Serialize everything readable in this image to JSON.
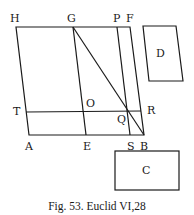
{
  "caption": "Fig. 53. Euclid VI,28",
  "labels": {
    "H": "H",
    "G": "G",
    "P": "P",
    "F": "F",
    "T": "T",
    "O": "O",
    "R": "R",
    "Q": "Q",
    "A": "A",
    "E": "E",
    "S": "S",
    "B": "B",
    "C": "C",
    "D": "D"
  },
  "points": {
    "H": [
      16,
      27
    ],
    "G": [
      73,
      27
    ],
    "P": [
      117,
      27
    ],
    "F": [
      130,
      27
    ],
    "T": [
      26,
      112
    ],
    "O": [
      83,
      112
    ],
    "Q": [
      128,
      111
    ],
    "R": [
      141,
      111
    ],
    "A": [
      29,
      135
    ],
    "E": [
      86,
      135
    ],
    "S": [
      130,
      135
    ],
    "B": [
      144,
      135
    ]
  },
  "shapes": {
    "D": [
      [
        143,
        26
      ],
      [
        176,
        26
      ],
      [
        183,
        81
      ],
      [
        149,
        81
      ]
    ],
    "C": [
      [
        115,
        151
      ],
      [
        179,
        151
      ],
      [
        179,
        190
      ],
      [
        115,
        190
      ]
    ]
  }
}
